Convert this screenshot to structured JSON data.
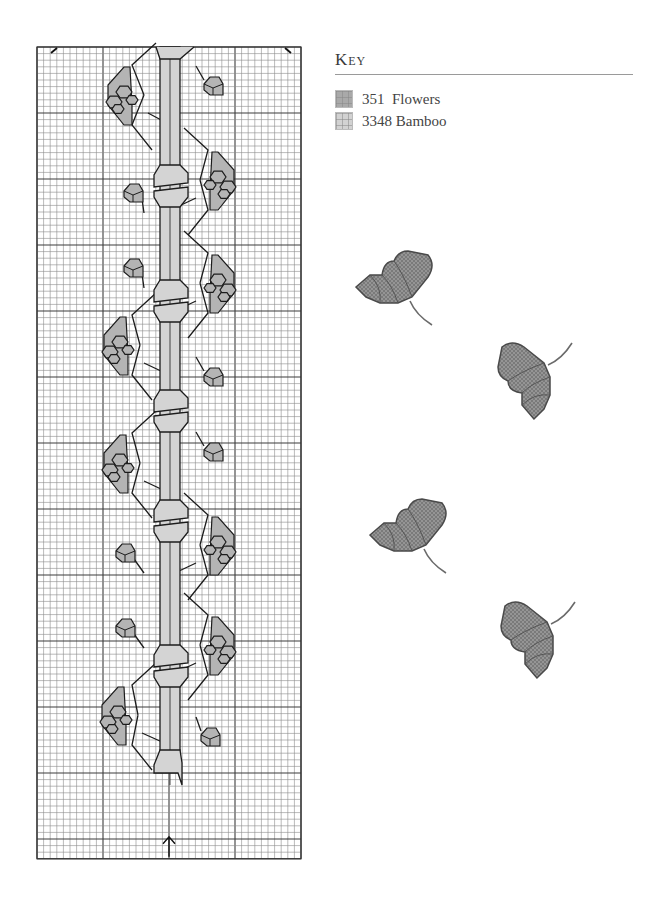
{
  "key": {
    "title": "Key",
    "items": [
      {
        "code": "351",
        "name": "Flowers",
        "label": "351  Flowers",
        "color": "#a9a9a9"
      },
      {
        "code": "3348",
        "name": "Bamboo",
        "label": "3348 Bamboo",
        "color": "#d2d2d2"
      }
    ]
  },
  "chart": {
    "grid": {
      "x": 37,
      "y": 47,
      "cols": 40,
      "rows": 123,
      "cell": 6.6,
      "major_every": 10,
      "line_color": "#8c8c8c",
      "major_color": "#3c3c3c"
    },
    "colors": {
      "flower_fill": "#b4b4b4",
      "bamboo_fill": "#d4d4d4",
      "outline": "#1c1c1c"
    },
    "center_arrows": {
      "top_col": 20,
      "bottom_col": 20
    },
    "corner_marks": [
      "top-left",
      "top-right"
    ],
    "bamboo": {
      "x_left": 160,
      "x_right": 180,
      "top": 47,
      "bottom": 785,
      "joints_y": [
        185,
        300,
        410,
        520,
        665
      ]
    },
    "flowers_large": [
      {
        "cx": 122,
        "cy": 95,
        "side": "left"
      },
      {
        "cx": 220,
        "cy": 180,
        "side": "right"
      },
      {
        "cx": 220,
        "cy": 283,
        "side": "right"
      },
      {
        "cx": 118,
        "cy": 345,
        "side": "left"
      },
      {
        "cx": 118,
        "cy": 463,
        "side": "left"
      },
      {
        "cx": 220,
        "cy": 545,
        "side": "right"
      },
      {
        "cx": 220,
        "cy": 645,
        "side": "right"
      },
      {
        "cx": 116,
        "cy": 715,
        "side": "left"
      }
    ],
    "flowers_small": [
      {
        "cx": 213,
        "cy": 86
      },
      {
        "cx": 133,
        "cy": 193
      },
      {
        "cx": 133,
        "cy": 268
      },
      {
        "cx": 213,
        "cy": 377
      },
      {
        "cx": 213,
        "cy": 452
      },
      {
        "cx": 125,
        "cy": 553
      },
      {
        "cx": 125,
        "cy": 628
      },
      {
        "cx": 210,
        "cy": 737
      }
    ]
  },
  "photos": [
    {
      "name": "stitched-flower-1",
      "x": 352,
      "y": 245,
      "rotate": 0
    },
    {
      "name": "stitched-flower-2",
      "x": 487,
      "y": 348,
      "rotate": -90
    },
    {
      "name": "stitched-flower-3",
      "x": 366,
      "y": 493,
      "rotate": 0
    },
    {
      "name": "stitched-flower-4",
      "x": 490,
      "y": 607,
      "rotate": -90
    }
  ]
}
